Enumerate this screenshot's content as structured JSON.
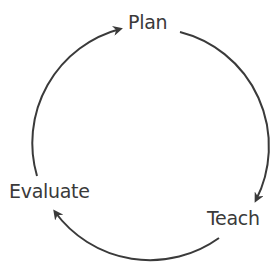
{
  "diagram": {
    "type": "cycle",
    "nodes": [
      {
        "id": "plan",
        "label": "Plan"
      },
      {
        "id": "teach",
        "label": "Teach"
      },
      {
        "id": "evaluate",
        "label": "Evaluate"
      }
    ],
    "edges": [
      {
        "from": "plan",
        "to": "teach"
      },
      {
        "from": "teach",
        "to": "evaluate"
      },
      {
        "from": "evaluate",
        "to": "plan"
      }
    ],
    "colors": {
      "stroke": "#3a3a3a",
      "text": "#3a3a3a",
      "background": "#ffffff"
    }
  }
}
